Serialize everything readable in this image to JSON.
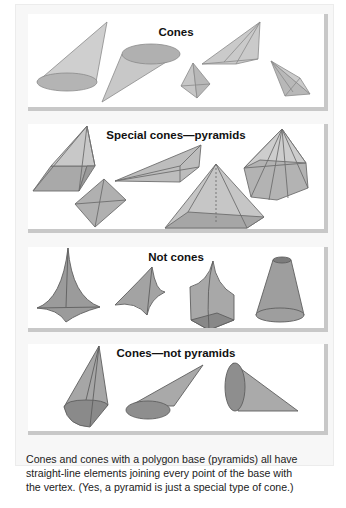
{
  "panels": [
    {
      "title": "Cones"
    },
    {
      "title": "Special cones—pyramids"
    },
    {
      "title": "Not cones"
    },
    {
      "title": "Cones—not pyramids"
    }
  ],
  "caption": {
    "line1": "Cones and cones with a polygon base (pyramids) all have",
    "line2": "straight-line elements joining every point of the base with",
    "line3": "the vertex. (Yes, a pyramid is just a special type of cone.)"
  },
  "colors": {
    "light_fill": "#c4c4c4",
    "base_fill": "#a9a9a9",
    "dark_fill": "#8e8e8e",
    "edge": "#6a6a6a",
    "panel_shadow": "#c8c8c8"
  }
}
